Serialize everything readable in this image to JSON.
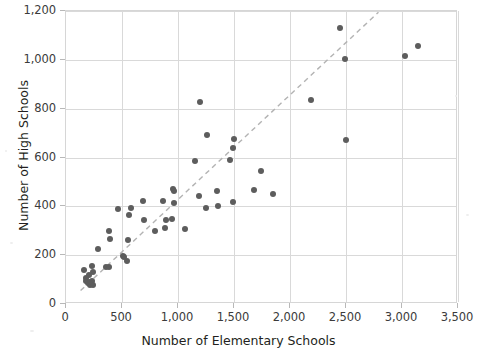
{
  "chart_data": {
    "type": "scatter",
    "title": "",
    "xlabel": "Number of Elementary Schools",
    "ylabel": "Number of High Schools",
    "xlim": [
      0,
      3500
    ],
    "ylim": [
      0,
      1200
    ],
    "xticks": [
      "0",
      "500",
      "1,000",
      "1,500",
      "2,000",
      "2,500",
      "3,000",
      "3,500"
    ],
    "xtick_values": [
      0,
      500,
      1000,
      1500,
      2000,
      2500,
      3000,
      3500
    ],
    "yticks": [
      "0",
      "200",
      "400",
      "600",
      "800",
      "1,000",
      "1,200"
    ],
    "ytick_values": [
      0,
      200,
      400,
      600,
      800,
      1000,
      1200
    ],
    "grid": true,
    "legend": "none",
    "point_color": "#5d5d5d",
    "trendline": {
      "style": "dashed",
      "color": "#b3b3b3",
      "x_start": 130,
      "y_start": 55,
      "x_end": 2790,
      "y_end": 1195
    },
    "points": [
      [
        160,
        140
      ],
      [
        175,
        105
      ],
      [
        180,
        95
      ],
      [
        195,
        88
      ],
      [
        205,
        118
      ],
      [
        210,
        90
      ],
      [
        215,
        78
      ],
      [
        225,
        82
      ],
      [
        230,
        155
      ],
      [
        235,
        95
      ],
      [
        240,
        130
      ],
      [
        245,
        78
      ],
      [
        285,
        225
      ],
      [
        355,
        150
      ],
      [
        380,
        150
      ],
      [
        385,
        298
      ],
      [
        390,
        268
      ],
      [
        460,
        388
      ],
      [
        510,
        198
      ],
      [
        520,
        192
      ],
      [
        545,
        176
      ],
      [
        555,
        262
      ],
      [
        565,
        365
      ],
      [
        580,
        393
      ],
      [
        690,
        420
      ],
      [
        700,
        345
      ],
      [
        795,
        297
      ],
      [
        870,
        422
      ],
      [
        880,
        312
      ],
      [
        895,
        345
      ],
      [
        945,
        350
      ],
      [
        955,
        472
      ],
      [
        960,
        462
      ],
      [
        965,
        413
      ],
      [
        1060,
        306
      ],
      [
        1155,
        585
      ],
      [
        1185,
        444
      ],
      [
        1200,
        828
      ],
      [
        1250,
        393
      ],
      [
        1255,
        693
      ],
      [
        1345,
        462
      ],
      [
        1355,
        401
      ],
      [
        1465,
        590
      ],
      [
        1490,
        418
      ],
      [
        1495,
        637
      ],
      [
        1500,
        677
      ],
      [
        1680,
        468
      ],
      [
        1740,
        545
      ],
      [
        1850,
        452
      ],
      [
        2190,
        835
      ],
      [
        2450,
        1130
      ],
      [
        2490,
        1005
      ],
      [
        2500,
        672
      ],
      [
        3030,
        1015
      ],
      [
        3140,
        1055
      ]
    ]
  }
}
